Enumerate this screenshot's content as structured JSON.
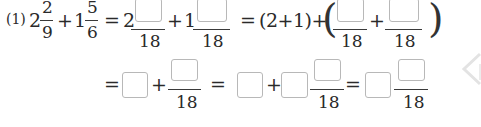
{
  "problem": {
    "label": "(1)",
    "expression": {
      "term1": {
        "whole": "2",
        "numerator": "2",
        "denominator": "9"
      },
      "op1": "+",
      "term2": {
        "whole": "1",
        "numerator": "5",
        "denominator": "6"
      }
    },
    "row1": {
      "eq1": "=",
      "step1_whole1": "2",
      "step1_den1": "18",
      "step1_plus": "+",
      "step1_whole2": "1",
      "step1_den2": "18",
      "eq2": "=",
      "grouped": "(2+1)+",
      "paren_open": "(",
      "step2_den1": "18",
      "step2_plus": "+",
      "step2_den2": "18",
      "paren_close": ")"
    },
    "row2": {
      "eq1": "=",
      "plus1": "+",
      "den1": "18",
      "eq2": "=",
      "plus2": "+",
      "den2": "18",
      "eq3": "=",
      "den3": "18"
    }
  },
  "icons": {
    "side_arrow": "chevron-left-icon"
  },
  "colors": {
    "text": "#2a2a2a",
    "box_border": "#b8b8b8",
    "arrow": "#e6e6e6"
  }
}
